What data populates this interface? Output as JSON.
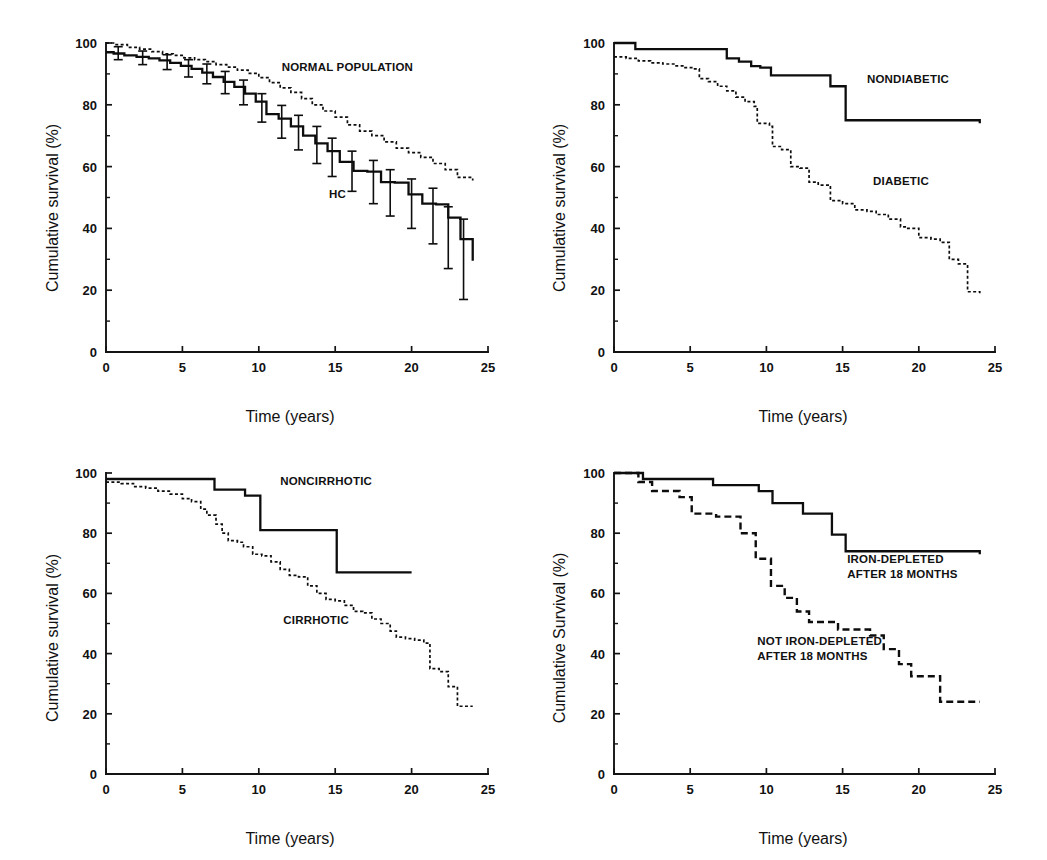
{
  "figure": {
    "name": "kaplan-meier-survival-panels",
    "panel_count": 4,
    "background": "#ffffff",
    "ink": "#111111"
  },
  "chart_data": [
    {
      "id": "panel-a",
      "type": "line",
      "title": "",
      "xlabel": "Time (years)",
      "ylabel": "Cumulative survival (%)",
      "xlim": [
        0,
        25
      ],
      "ylim": [
        0,
        100
      ],
      "xticks": [
        0,
        5,
        10,
        15,
        20,
        25
      ],
      "xticklabels": [
        "0",
        "5",
        "10",
        "15",
        "20",
        "25"
      ],
      "yticks": [
        0,
        20,
        40,
        60,
        80,
        100
      ],
      "yticklabels": [
        "0",
        "20",
        "40",
        "60",
        "80",
        "100"
      ],
      "yminorticks": [
        10,
        30,
        50,
        70,
        90
      ],
      "grid": false,
      "legend_position": "inline-annotations",
      "annotations": [
        {
          "text": "NORMAL POPULATION",
          "x": 11.5,
          "y": 91
        },
        {
          "text": "HC",
          "x": 14.6,
          "y": 50
        }
      ],
      "series": [
        {
          "name": "NORMAL POPULATION",
          "style": "dotted",
          "x": [
            0,
            0.6,
            1.4,
            2.2,
            3.0,
            3.7,
            4.4,
            5.1,
            5.8,
            6.5,
            7.2,
            7.9,
            8.6,
            9.3,
            10.0,
            10.7,
            11.4,
            12.1,
            12.8,
            13.5,
            14.2,
            15.0,
            15.8,
            16.6,
            17.4,
            18.2,
            19.0,
            19.8,
            20.6,
            21.4,
            22.2,
            23.0,
            24.0
          ],
          "values": [
            100,
            99.5,
            98.6,
            98.0,
            97.2,
            96.5,
            96.0,
            95.2,
            94.6,
            94.0,
            93.0,
            92.2,
            91.2,
            90.2,
            88.8,
            87.2,
            85.5,
            84.0,
            82.0,
            80.0,
            78.0,
            76.0,
            73.5,
            71.5,
            70.0,
            68.0,
            66.0,
            64.5,
            63.0,
            61.0,
            59.0,
            56.5,
            55.5
          ]
        },
        {
          "name": "HC",
          "style": "solid",
          "x": [
            0,
            0.5,
            1.2,
            2.0,
            2.8,
            3.5,
            4.2,
            4.9,
            5.6,
            6.3,
            7.0,
            7.7,
            8.4,
            9.1,
            9.8,
            10.5,
            11.3,
            12.1,
            12.9,
            13.7,
            14.5,
            15.3,
            16.2,
            17.1,
            18.0,
            18.9,
            19.8,
            20.7,
            21.6,
            22.4,
            23.2,
            24.0
          ],
          "values": [
            97.0,
            96.6,
            96.0,
            95.5,
            95.0,
            94.4,
            93.6,
            92.6,
            91.6,
            90.4,
            89.0,
            87.4,
            85.8,
            83.6,
            81.0,
            77.0,
            75.5,
            73.0,
            70.0,
            67.5,
            65.0,
            61.5,
            58.6,
            58.4,
            55.0,
            54.8,
            51.0,
            48.0,
            47.8,
            43.5,
            36.5,
            29.5
          ],
          "error_bars": [
            {
              "x": 0.8,
              "y": 96.6,
              "lo": 94.6,
              "hi": 98.8
            },
            {
              "x": 2.4,
              "y": 95.2,
              "lo": 93.0,
              "hi": 97.4
            },
            {
              "x": 4.0,
              "y": 93.8,
              "lo": 91.4,
              "hi": 96.2
            },
            {
              "x": 5.4,
              "y": 91.8,
              "lo": 89.0,
              "hi": 94.6
            },
            {
              "x": 6.6,
              "y": 90.0,
              "lo": 86.8,
              "hi": 93.2
            },
            {
              "x": 7.8,
              "y": 87.2,
              "lo": 83.6,
              "hi": 90.8
            },
            {
              "x": 9.0,
              "y": 84.0,
              "lo": 80.0,
              "hi": 88.0
            },
            {
              "x": 10.2,
              "y": 79.0,
              "lo": 74.4,
              "hi": 83.6
            },
            {
              "x": 11.5,
              "y": 74.5,
              "lo": 69.2,
              "hi": 79.8
            },
            {
              "x": 12.6,
              "y": 71.0,
              "lo": 65.4,
              "hi": 76.6
            },
            {
              "x": 13.8,
              "y": 67.0,
              "lo": 61.0,
              "hi": 73.0
            },
            {
              "x": 14.8,
              "y": 63.0,
              "lo": 56.8,
              "hi": 69.2
            },
            {
              "x": 16.1,
              "y": 58.5,
              "lo": 52.0,
              "hi": 65.0
            },
            {
              "x": 17.5,
              "y": 55.0,
              "lo": 48.0,
              "hi": 62.0
            },
            {
              "x": 18.6,
              "y": 51.5,
              "lo": 44.0,
              "hi": 59.0
            },
            {
              "x": 20.0,
              "y": 48.0,
              "lo": 40.0,
              "hi": 56.0
            },
            {
              "x": 21.4,
              "y": 44.0,
              "lo": 35.0,
              "hi": 53.0
            },
            {
              "x": 22.4,
              "y": 37.0,
              "lo": 27.0,
              "hi": 47.0
            },
            {
              "x": 23.4,
              "y": 30.0,
              "lo": 17.0,
              "hi": 43.0
            }
          ]
        }
      ]
    },
    {
      "id": "panel-b",
      "type": "line",
      "title": "",
      "xlabel": "Time (years)",
      "ylabel": "Cumulative survival (%)",
      "xlim": [
        0,
        25
      ],
      "ylim": [
        0,
        100
      ],
      "xticks": [
        0,
        5,
        10,
        15,
        20,
        25
      ],
      "xticklabels": [
        "0",
        "5",
        "10",
        "15",
        "20",
        "25"
      ],
      "yticks": [
        0,
        20,
        40,
        60,
        80,
        100
      ],
      "yticklabels": [
        "0",
        "20",
        "40",
        "60",
        "80",
        "100"
      ],
      "yminorticks": [
        10,
        30,
        50,
        70,
        90
      ],
      "grid": false,
      "legend_position": "inline-annotations",
      "annotations": [
        {
          "text": "NONDIABETIC",
          "x": 16.6,
          "y": 87
        },
        {
          "text": "DIABETIC",
          "x": 17.0,
          "y": 54
        }
      ],
      "series": [
        {
          "name": "NONDIABETIC",
          "style": "solid",
          "x": [
            0,
            1.3,
            1.4,
            7.3,
            7.4,
            8.2,
            9.0,
            9.6,
            10.3,
            13.2,
            14.2,
            15.1,
            15.2,
            24.0
          ],
          "values": [
            100,
            100,
            98.0,
            98.0,
            95.0,
            94.0,
            92.5,
            92.0,
            89.5,
            89.5,
            86.0,
            86.0,
            75.0,
            74.0
          ]
        },
        {
          "name": "DIABETIC",
          "style": "dotted",
          "x": [
            0,
            0.8,
            1.6,
            2.4,
            3.2,
            4.0,
            4.6,
            5.2,
            5.6,
            6.2,
            6.8,
            7.4,
            8.0,
            8.6,
            9.2,
            9.4,
            10.2,
            10.4,
            11.0,
            11.6,
            12.2,
            12.8,
            13.4,
            14.2,
            15.0,
            15.8,
            16.6,
            17.2,
            18.0,
            18.8,
            19.2,
            20.0,
            20.8,
            21.4,
            22.0,
            22.6,
            23.2,
            24.0
          ],
          "values": [
            95.5,
            95.0,
            94.2,
            93.6,
            93.2,
            92.6,
            92.0,
            91.6,
            88.5,
            87.5,
            86.0,
            84.5,
            82.5,
            81.0,
            79.5,
            74.0,
            73.0,
            66.5,
            65.5,
            60.0,
            59.5,
            55.0,
            54.0,
            49.0,
            48.0,
            46.0,
            45.5,
            44.5,
            43.0,
            40.5,
            40.0,
            37.0,
            36.5,
            35.5,
            30.0,
            28.5,
            19.5,
            19.0
          ]
        }
      ]
    },
    {
      "id": "panel-c",
      "type": "line",
      "title": "",
      "xlabel": "Time (years)",
      "ylabel": "Cumulative survival (%)",
      "xlim": [
        0,
        25
      ],
      "ylim": [
        0,
        100
      ],
      "xticks": [
        0,
        5,
        10,
        15,
        20,
        25
      ],
      "xticklabels": [
        "0",
        "5",
        "10",
        "15",
        "20",
        "25"
      ],
      "yticks": [
        0,
        20,
        40,
        60,
        80,
        100
      ],
      "yticklabels": [
        "0",
        "20",
        "40",
        "60",
        "80",
        "100"
      ],
      "yminorticks": [
        10,
        30,
        50,
        70,
        90
      ],
      "grid": false,
      "legend_position": "inline-annotations",
      "annotations": [
        {
          "text": "NONCIRRHOTIC",
          "x": 11.4,
          "y": 96
        },
        {
          "text": "CIRRHOTIC",
          "x": 11.6,
          "y": 50
        }
      ],
      "series": [
        {
          "name": "NONCIRRHOTIC",
          "style": "solid",
          "x": [
            0,
            7.0,
            7.1,
            9.0,
            9.1,
            10.0,
            10.1,
            15.0,
            15.1,
            20.0
          ],
          "values": [
            98.0,
            98.0,
            94.5,
            94.5,
            92.5,
            92.5,
            81.0,
            81.0,
            67.0,
            67.0
          ]
        },
        {
          "name": "CIRRHOTIC",
          "style": "dotted",
          "x": [
            0,
            1.0,
            1.8,
            2.6,
            3.4,
            4.2,
            5.0,
            5.6,
            6.2,
            6.6,
            7.2,
            7.6,
            8.0,
            8.6,
            9.0,
            9.6,
            10.2,
            10.8,
            11.4,
            12.0,
            12.6,
            13.2,
            13.8,
            14.4,
            15.0,
            15.6,
            16.2,
            16.8,
            17.4,
            18.0,
            18.6,
            19.0,
            19.6,
            20.2,
            20.8,
            21.2,
            21.8,
            22.4,
            23.0,
            24.0
          ],
          "values": [
            97.0,
            96.5,
            95.5,
            95.0,
            94.0,
            93.0,
            91.5,
            90.5,
            88.0,
            86.0,
            83.0,
            80.0,
            77.5,
            77.0,
            75.5,
            73.0,
            72.5,
            70.5,
            68.0,
            66.0,
            65.5,
            62.5,
            60.0,
            58.0,
            57.5,
            56.0,
            54.0,
            53.5,
            51.5,
            50.0,
            47.5,
            45.5,
            45.0,
            44.5,
            43.5,
            35.0,
            34.0,
            29.0,
            22.5,
            22.5
          ]
        }
      ]
    },
    {
      "id": "panel-d",
      "type": "line",
      "title": "",
      "xlabel": "Time (years)",
      "ylabel": "Cumulative Survival (%)",
      "xlim": [
        0,
        25
      ],
      "ylim": [
        0,
        100
      ],
      "xticks": [
        0,
        5,
        10,
        15,
        20,
        25
      ],
      "xticklabels": [
        "0",
        "5",
        "10",
        "15",
        "20",
        "25"
      ],
      "yticks": [
        0,
        20,
        40,
        60,
        80,
        100
      ],
      "yticklabels": [
        "0",
        "20",
        "40",
        "60",
        "80",
        "100"
      ],
      "yminorticks": [
        10,
        30,
        50,
        70,
        90
      ],
      "grid": false,
      "legend_position": "inline-annotations",
      "annotations": [
        {
          "text": "IRON-DEPLETED",
          "x": 15.3,
          "y": 70
        },
        {
          "text": "AFTER 18 MONTHS",
          "x": 15.3,
          "y": 65
        },
        {
          "text": "NOT IRON-DEPLETED",
          "x": 9.4,
          "y": 43
        },
        {
          "text": "AFTER 18 MONTHS",
          "x": 9.4,
          "y": 38
        }
      ],
      "series": [
        {
          "name": "IRON-DEPLETED AFTER 18 MONTHS",
          "style": "solid",
          "x": [
            0,
            1.8,
            1.9,
            6.4,
            6.5,
            9.4,
            9.5,
            10.3,
            10.4,
            12.3,
            12.4,
            14.2,
            14.3,
            15.1,
            15.2,
            24.0
          ],
          "values": [
            100,
            100,
            98.0,
            98.0,
            96.0,
            96.0,
            94.0,
            94.0,
            90.0,
            90.0,
            86.5,
            86.5,
            79.5,
            79.5,
            74.0,
            73.0
          ]
        },
        {
          "name": "NOT IRON-DEPLETED AFTER 18 MONTHS",
          "style": "dashed",
          "x": [
            0,
            1.5,
            1.6,
            2.4,
            2.5,
            4.2,
            4.3,
            5.0,
            5.1,
            6.6,
            6.7,
            8.2,
            8.3,
            9.2,
            9.3,
            10.2,
            10.3,
            11.1,
            11.2,
            11.9,
            12.0,
            12.7,
            12.8,
            14.6,
            14.7,
            16.7,
            16.8,
            17.6,
            17.7,
            18.6,
            18.7,
            19.4,
            19.5,
            20.2,
            20.3,
            21.3,
            21.4,
            24.0
          ],
          "values": [
            100,
            100,
            97.0,
            97.0,
            94.0,
            94.0,
            92.0,
            92.0,
            86.5,
            86.5,
            85.5,
            85.5,
            80.0,
            80.0,
            71.5,
            71.5,
            62.5,
            62.5,
            58.5,
            58.5,
            54.0,
            54.0,
            50.5,
            50.5,
            48.0,
            48.0,
            46.0,
            46.0,
            41.5,
            41.5,
            36.5,
            36.5,
            32.5,
            32.5,
            32.5,
            32.5,
            24.0,
            24.0
          ]
        }
      ]
    }
  ]
}
